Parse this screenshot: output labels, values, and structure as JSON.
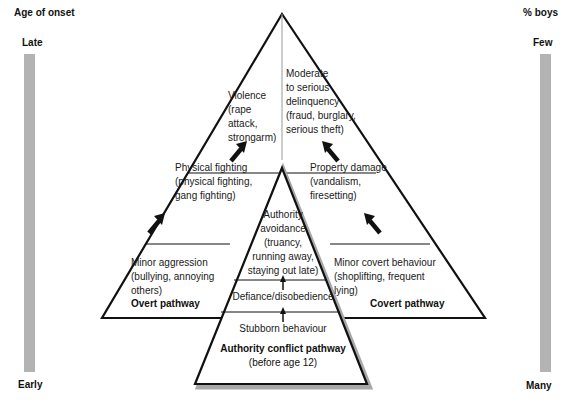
{
  "left_axis": {
    "title": "Age of onset",
    "top_label": "Late",
    "bottom_label": "Early"
  },
  "right_axis": {
    "title": "% boys",
    "top_label": "Few",
    "bottom_label": "Many"
  },
  "overt_pathway": {
    "label": "Overt pathway",
    "stages": [
      {
        "lines": [
          "Minor aggression",
          "(bullying, annoying",
          "others)"
        ]
      },
      {
        "lines": [
          "Physical fighting",
          "(physical fighting,",
          "gang fighting)"
        ]
      },
      {
        "lines": [
          "Violence",
          "(rape",
          "attack,",
          "strongarm)"
        ]
      }
    ]
  },
  "covert_pathway": {
    "label": "Covert pathway",
    "stages": [
      {
        "lines": [
          "Minor covert behaviour",
          "(shoplifting, frequent",
          "lying)"
        ]
      },
      {
        "lines": [
          "Property damage",
          "(vandalism,",
          "firesetting)"
        ]
      },
      {
        "lines": [
          "Moderate",
          "to serious",
          "delinquency",
          "(fraud, burglary,",
          "serious theft)"
        ]
      }
    ]
  },
  "authority_conflict_pathway": {
    "label_lines": [
      "Authority conflict pathway",
      "(before age 12)"
    ],
    "stages": [
      {
        "lines": [
          "Stubborn behaviour"
        ]
      },
      {
        "lines": [
          "Defiance/disobedience"
        ]
      },
      {
        "lines": [
          "Authority",
          "avoidance",
          "(truancy,",
          "running away,",
          "staying out late)"
        ]
      }
    ]
  },
  "colors": {
    "line": "#111111",
    "axis_bar": "#b3b3b3",
    "inner_shadow": "#a8a8a8"
  }
}
